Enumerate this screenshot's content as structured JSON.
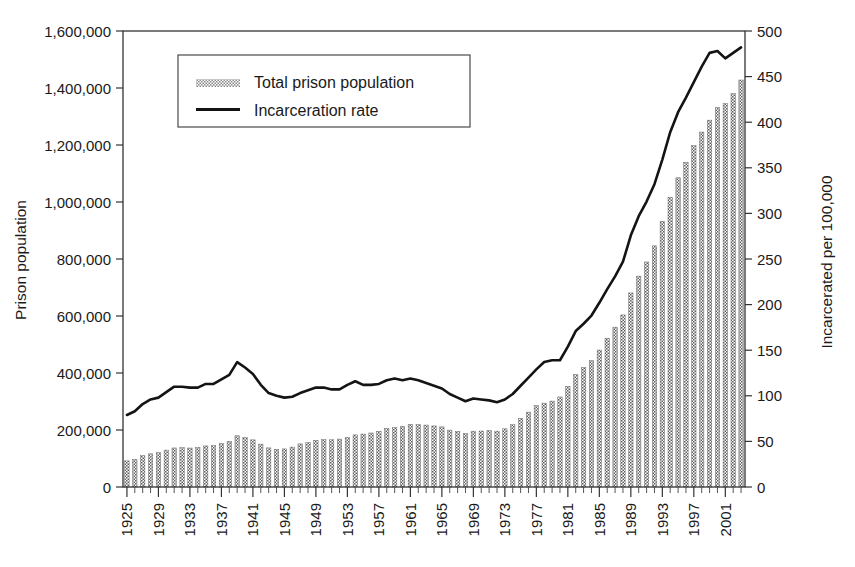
{
  "chart_data": {
    "type": "bar",
    "title": "",
    "subtitle": "",
    "xlabel": "",
    "ylabel": "Prison population",
    "y2label": "Incarcerated per 100,000",
    "ylim": [
      0,
      1600000
    ],
    "y2lim": [
      0,
      500
    ],
    "xlim": [
      1925,
      2003
    ],
    "grid": false,
    "legend_position": "upper-left-inside",
    "y_ticks": [
      "0",
      "200,000",
      "400,000",
      "600,000",
      "800,000",
      "1,000,000",
      "1,200,000",
      "1,400,000",
      "1,600,000"
    ],
    "y_tick_values": [
      0,
      200000,
      400000,
      600000,
      800000,
      1000000,
      1200000,
      1400000,
      1600000
    ],
    "y2_ticks": [
      "0",
      "50",
      "100",
      "150",
      "200",
      "250",
      "300",
      "350",
      "400",
      "450",
      "500"
    ],
    "y2_tick_values": [
      0,
      50,
      100,
      150,
      200,
      250,
      300,
      350,
      400,
      450,
      500
    ],
    "x_tick_labels": [
      "1925",
      "1929",
      "1933",
      "1937",
      "1941",
      "1945",
      "1949",
      "1953",
      "1957",
      "1961",
      "1965",
      "1969",
      "1973",
      "1977",
      "1981",
      "1985",
      "1989",
      "1993",
      "1997",
      "2001"
    ],
    "x_tick_label_values": [
      1925,
      1929,
      1933,
      1937,
      1941,
      1945,
      1949,
      1953,
      1957,
      1961,
      1965,
      1969,
      1973,
      1977,
      1981,
      1985,
      1989,
      1993,
      1997,
      2001
    ],
    "x": [
      1925,
      1926,
      1927,
      1928,
      1929,
      1930,
      1931,
      1932,
      1933,
      1934,
      1935,
      1936,
      1937,
      1938,
      1939,
      1940,
      1941,
      1942,
      1943,
      1944,
      1945,
      1946,
      1947,
      1948,
      1949,
      1950,
      1951,
      1952,
      1953,
      1954,
      1955,
      1956,
      1957,
      1958,
      1959,
      1960,
      1961,
      1962,
      1963,
      1964,
      1965,
      1966,
      1967,
      1968,
      1969,
      1970,
      1971,
      1972,
      1973,
      1974,
      1975,
      1976,
      1977,
      1978,
      1979,
      1980,
      1981,
      1982,
      1983,
      1984,
      1985,
      1986,
      1987,
      1988,
      1989,
      1990,
      1991,
      1992,
      1993,
      1994,
      1995,
      1996,
      1997,
      1998,
      1999,
      2000,
      2001,
      2002,
      2003
    ],
    "series": [
      {
        "name": "Total prison population",
        "kind": "bar",
        "axis": "left",
        "color": "#707070",
        "pattern": "checkered",
        "values": [
          91669,
          97000,
          109983,
          116390,
          120496,
          129453,
          137000,
          137997,
          136810,
          138316,
          144180,
          145038,
          152741,
          160285,
          179818,
          173706,
          165439,
          150384,
          137220,
          132456,
          133649,
          140079,
          151304,
          155977,
          163749,
          166123,
          165680,
          168233,
          173579,
          182901,
          185780,
          189565,
          195414,
          205643,
          208105,
          212953,
          220149,
          218830,
          217283,
          214336,
          210895,
          199654,
          194896,
          187914,
          196007,
          196441,
          198061,
          196092,
          204211,
          218466,
          240593,
          262833,
          285456,
          294396,
          301470,
          315974,
          353167,
          394374,
          419346,
          443398,
          480568,
          522084,
          560812,
          603732,
          680907,
          739980,
          789610,
          846277,
          932074,
          1016691,
          1085022,
          1138984,
          1197590,
          1245402,
          1287172,
          1331278,
          1345217,
          1380516,
          1428040
        ]
      },
      {
        "name": "Incarceration rate",
        "kind": "line",
        "axis": "right",
        "color": "#141414",
        "unit": "per 100,000",
        "values": [
          79,
          83,
          91,
          96,
          98,
          104,
          110,
          110,
          109,
          109,
          113,
          113,
          118,
          123,
          137,
          131,
          124,
          112,
          103,
          100,
          98,
          99,
          103,
          106,
          109,
          109,
          107,
          107,
          112,
          116,
          112,
          112,
          113,
          117,
          119,
          117,
          119,
          117,
          114,
          111,
          108,
          102,
          98,
          94,
          97,
          96,
          95,
          93,
          96,
          102,
          111,
          120,
          129,
          137,
          139,
          139,
          154,
          171,
          179,
          188,
          202,
          217,
          231,
          247,
          276,
          297,
          313,
          332,
          359,
          389,
          411,
          427,
          444,
          461,
          476,
          478,
          470,
          476,
          482
        ]
      }
    ],
    "legend": [
      {
        "label": "Total prison population",
        "swatch": "bar-hatch",
        "color": "#707070"
      },
      {
        "label": "Incarceration rate",
        "swatch": "line",
        "color": "#141414"
      }
    ]
  },
  "axes": {
    "left_title": "Prison population",
    "right_title": "Incarcerated per 100,000"
  }
}
